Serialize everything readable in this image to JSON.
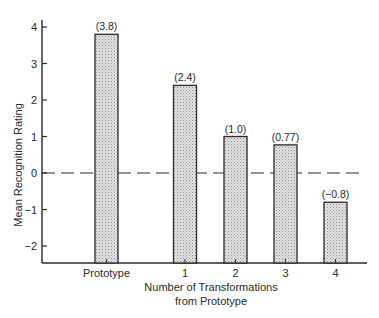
{
  "chart_data": {
    "type": "bar",
    "title": "",
    "xlabel": "Number of Transformations from Prototype",
    "xlabel_lines": [
      "Number of Transformations",
      "from Prototype"
    ],
    "ylabel": "Mean Recognition Rating",
    "ylim": [
      -2.5,
      4.2
    ],
    "yticks": [
      4,
      3,
      2,
      1,
      0,
      -1,
      -2
    ],
    "ytick_labels": [
      "4",
      "3",
      "2",
      "1",
      "0",
      "−1",
      "−2"
    ],
    "categories": [
      "Prototype",
      "1",
      "2",
      "3",
      "4"
    ],
    "values": [
      3.8,
      2.4,
      1.0,
      0.77,
      -0.8
    ],
    "value_labels": [
      "(3.8)",
      "(2.4)",
      "(1.0)",
      "(0.77)",
      "(−0.8)"
    ],
    "reference_line": {
      "y": 0,
      "style": "dashed"
    },
    "grid": false,
    "legend": null,
    "bar_fill": "stippled gray",
    "colors": {
      "ink": "#2a2a2a",
      "bar_fill": "#cfcfcf"
    }
  }
}
